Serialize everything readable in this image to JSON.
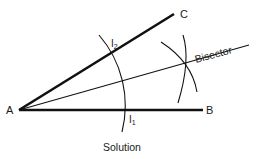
{
  "diagram": {
    "colors": {
      "stroke": "#111111",
      "text": "#1a1a1a",
      "background": "#ffffff"
    },
    "points": {
      "A": {
        "label": "A",
        "x": 19,
        "y": 110
      },
      "B": {
        "label": "B",
        "x": 203,
        "y": 110
      },
      "C": {
        "label": "C",
        "x": 174,
        "y": 14
      },
      "I1": {
        "label": "I",
        "sub": "1",
        "x": 126,
        "y": 110
      },
      "I2": {
        "label": "I",
        "sub": "2",
        "x": 112,
        "y": 55
      },
      "X": {
        "label": "",
        "x": 185,
        "y": 66
      }
    },
    "labels": {
      "A": "A",
      "B": "B",
      "C": "C",
      "I1_main": "I",
      "I1_sub": "1",
      "I2_main": "I",
      "I2_sub": "2",
      "bisector": "Bisector",
      "solution": "Solution"
    }
  }
}
